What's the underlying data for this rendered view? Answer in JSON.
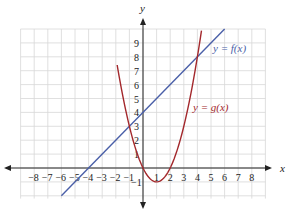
{
  "chart_data": {
    "type": "line",
    "title": "",
    "xlabel": "x",
    "ylabel": "y",
    "xlim": [
      -9,
      9
    ],
    "ylim": [
      -2,
      10
    ],
    "grid": true,
    "x_ticks": [
      "-8",
      "-7",
      "-6",
      "-5",
      "-4",
      "-3",
      "-2",
      "-1",
      "1",
      "2",
      "3",
      "4",
      "5",
      "6",
      "7",
      "8"
    ],
    "y_ticks": [
      "-1",
      "1",
      "2",
      "3",
      "4",
      "5",
      "6",
      "7",
      "8",
      "9"
    ],
    "series": [
      {
        "name": "y = f(x)",
        "color": "#4a5fa8",
        "kind": "linear",
        "formula": "x + 4",
        "x": [
          -6,
          -4,
          0,
          4,
          6
        ],
        "values": [
          -2,
          0,
          4,
          8,
          10
        ]
      },
      {
        "name": "y = g(x)",
        "color": "#a3282c",
        "kind": "quadratic",
        "formula": "x^2 - 2x",
        "x": [
          -1.9,
          -1,
          0,
          1,
          2,
          3,
          4,
          4.3
        ],
        "values": [
          7.4,
          3,
          0,
          -1,
          0,
          3,
          8,
          9.9
        ]
      }
    ],
    "labels": {
      "f": "y = f(x)",
      "g": "y = g(x)"
    }
  },
  "axes": {
    "x_label": "x",
    "y_label": "y"
  }
}
